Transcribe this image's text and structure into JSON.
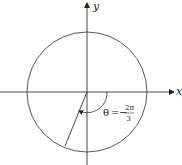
{
  "diagram": {
    "axes": {
      "x_label": "x",
      "y_label": "y"
    },
    "circle": {
      "cx": 87,
      "cy": 92,
      "r": 60
    },
    "angle": {
      "symbol": "θ",
      "equals": "=",
      "sign": "−",
      "numerator": "2π",
      "denominator": "3",
      "value_text": "θ = −2π/3"
    },
    "colors": {
      "stroke": "#333333",
      "background": "#ffffff"
    }
  }
}
